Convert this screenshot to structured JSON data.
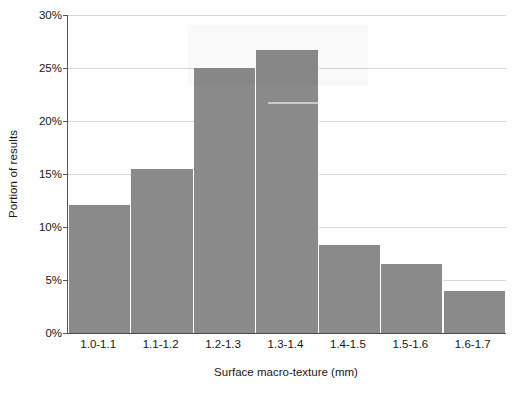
{
  "chart_data": {
    "type": "bar",
    "title": "",
    "subtitle": "",
    "xlabel": "Surface macro-texture (mm)",
    "ylabel": "Portion of results",
    "categories": [
      "1.0-1.1",
      "1.1-1.2",
      "1.2-1.3",
      "1.3-1.4",
      "1.4-1.5",
      "1.5-1.6",
      "1.6-1.7"
    ],
    "values": [
      12.1,
      15.5,
      25.0,
      26.7,
      8.3,
      6.5,
      4.0
    ],
    "value_unit": "%",
    "ylim": [
      0,
      30
    ],
    "ytick_values": [
      0,
      5,
      10,
      15,
      20,
      25,
      30
    ],
    "ytick_labels": [
      "0%",
      "5%",
      "10%",
      "15%",
      "20%",
      "25%",
      "30%"
    ],
    "grid": true,
    "grid_axis": "y",
    "legend": false,
    "legend_position": "none",
    "bar_color": "#8a8a8a",
    "bar_gap": 0,
    "gridline_color": "#d8d8d8",
    "axis_color": "#555555",
    "background_color": "#fefefe"
  },
  "axes": {
    "y_title": "Portion of results",
    "x_title": "Surface macro-texture (mm)"
  }
}
